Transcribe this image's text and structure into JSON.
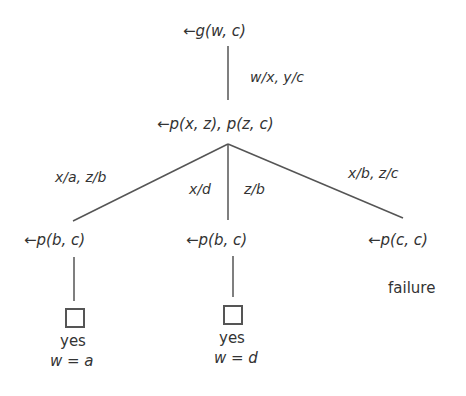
{
  "diagram": {
    "type": "sld-resolution-tree",
    "nodes": {
      "root": {
        "arrow": "←",
        "goal": "g(w, c)"
      },
      "middle": {
        "arrow": "←",
        "goal": "p(x, z), p(z, c)"
      },
      "left": {
        "arrow": "←",
        "goal": "p(b, c)",
        "result": "yes",
        "answer": "w = a"
      },
      "center": {
        "arrow": "←",
        "goal": "p(b, c)",
        "result": "yes",
        "answer": "w = d"
      },
      "right": {
        "arrow": "←",
        "goal": "p(c, c)",
        "result": "failure"
      }
    },
    "edges": {
      "root_middle": "w/x, y/c",
      "middle_left": "x/a, z/b",
      "middle_center_a": "x/d",
      "middle_center_b": "z/b",
      "middle_right": "x/b, z/c"
    },
    "colors": {
      "line": "#555555",
      "text": "#333333"
    }
  }
}
